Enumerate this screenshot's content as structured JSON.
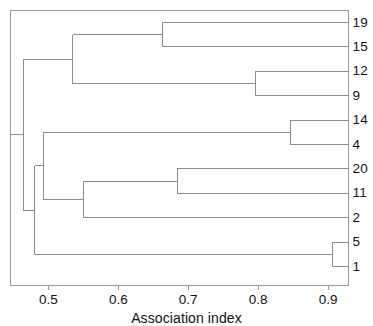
{
  "figure": {
    "kind": "dendrogram",
    "background_color": "#ffffff",
    "line_color": "#8c8c8c",
    "frame_color": "#9a9a9a",
    "text_color": "#111111"
  },
  "axis": {
    "title": "Association index",
    "tick_labels": [
      "0.5",
      "0.6",
      "0.7",
      "0.8",
      "0.9"
    ],
    "tick_values": [
      0.5,
      0.6,
      0.7,
      0.8,
      0.9
    ],
    "range": [
      0.446,
      0.929
    ],
    "orientation": "horizontal-bottom"
  },
  "leaves": [
    {
      "label": "19",
      "index": 0
    },
    {
      "label": "15",
      "index": 1
    },
    {
      "label": "12",
      "index": 2
    },
    {
      "label": "9",
      "index": 3
    },
    {
      "label": "14",
      "index": 4
    },
    {
      "label": "4",
      "index": 5
    },
    {
      "label": "20",
      "index": 6
    },
    {
      "label": "11",
      "index": 7
    },
    {
      "label": "2",
      "index": 8
    },
    {
      "label": "5",
      "index": 9
    },
    {
      "label": "1",
      "index": 10
    }
  ],
  "chart_data": {
    "type": "dendrogram",
    "title": "",
    "xlabel": "Association index",
    "ylabel": "",
    "xlim": [
      0.446,
      0.929
    ],
    "grid": false,
    "legend": "none",
    "leaf_order": [
      "19",
      "15",
      "12",
      "9",
      "14",
      "4",
      "20",
      "11",
      "2",
      "5",
      "1"
    ],
    "merges": [
      {
        "id": "m1",
        "children": [
          "19",
          "15"
        ],
        "height": 0.663
      },
      {
        "id": "m2",
        "children": [
          "12",
          "9"
        ],
        "height": 0.796
      },
      {
        "id": "m3",
        "children": [
          "m1",
          "m2"
        ],
        "height": 0.535
      },
      {
        "id": "m4",
        "children": [
          "14",
          "4"
        ],
        "height": 0.846
      },
      {
        "id": "m5",
        "children": [
          "20",
          "11"
        ],
        "height": 0.684
      },
      {
        "id": "m6",
        "children": [
          "m5",
          "2"
        ],
        "height": 0.551
      },
      {
        "id": "m7",
        "children": [
          "m4",
          "m6"
        ],
        "height": 0.493
      },
      {
        "id": "m8",
        "children": [
          "5",
          "1"
        ],
        "height": 0.906
      },
      {
        "id": "m9",
        "children": [
          "m7",
          "m8"
        ],
        "height": 0.481
      },
      {
        "id": "m10",
        "children": [
          "m3",
          "m9"
        ],
        "height": 0.464
      }
    ]
  }
}
